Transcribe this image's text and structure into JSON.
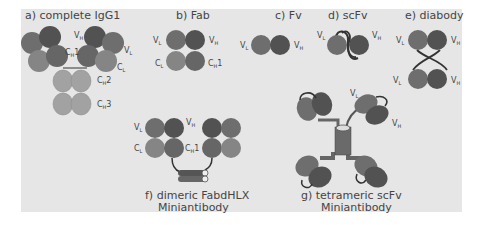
{
  "colors": {
    "background": "#e6e6e6",
    "vh": "#5a5a5a",
    "vl": "#727272",
    "cl": "#858585",
    "ch1": "#6a6a6a",
    "fc": "#a2a2a2",
    "linker": "#333333",
    "text": "#444444"
  },
  "panels": [
    {
      "id": "a",
      "caption": "a) complete IgG1",
      "labels": {
        "vh": "V",
        "vh_sub": "H",
        "vl": "V",
        "vl_sub": "L",
        "ch1": "C",
        "ch1_sub": "H",
        "ch1_suffix": "1",
        "cl": "C",
        "cl_sub": "L",
        "ch2": "C",
        "ch2_sub": "H",
        "ch2_suffix": "2",
        "ch3": "C",
        "ch3_sub": "H",
        "ch3_suffix": "3"
      }
    },
    {
      "id": "b",
      "caption": "b) Fab",
      "labels": {
        "vl": "V",
        "vl_sub": "L",
        "vh": "V",
        "vh_sub": "H",
        "cl": "C",
        "cl_sub": "L",
        "ch1": "C",
        "ch1_sub": "H",
        "ch1_suffix": "1"
      }
    },
    {
      "id": "c",
      "caption": "c) Fv",
      "labels": {
        "vl": "V",
        "vl_sub": "L",
        "vh": "V",
        "vh_sub": "H"
      }
    },
    {
      "id": "d",
      "caption": "d) scFv",
      "labels": {
        "vl": "V",
        "vl_sub": "L",
        "vh": "V",
        "vh_sub": "H"
      }
    },
    {
      "id": "e",
      "caption": "e) diabody",
      "labels": {
        "vl_top": "V",
        "vl_top_sub": "L",
        "vh_top": "V",
        "vh_top_sub": "H",
        "vl_bottom": "V",
        "vl_bottom_sub": "L",
        "vh_bottom": "V",
        "vh_bottom_sub": "H"
      }
    },
    {
      "id": "f",
      "caption_line1": "f) dimeric FabdHLX",
      "caption_line2": "Miniantibody",
      "labels": {
        "vl": "V",
        "vl_sub": "L",
        "vh": "V",
        "vh_sub": "H",
        "cl": "C",
        "cl_sub": "L",
        "ch1": "C",
        "ch1_sub": "H",
        "ch1_suffix": "1"
      }
    },
    {
      "id": "g",
      "caption_line1": "g) tetrameric scFv",
      "caption_line2": "Miniantibody",
      "labels": {
        "vl": "V",
        "vl_sub": "L",
        "vh": "V",
        "vh_sub": "H"
      }
    }
  ]
}
